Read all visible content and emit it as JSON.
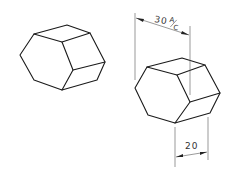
{
  "figure": {
    "left_prism": {
      "label": "hexagonal-prism"
    },
    "right_prism": {
      "label": "hexagonal-prism-dimensioned",
      "dimensions": {
        "across_corners": {
          "value": "30",
          "suffix_top": "A",
          "suffix_bottom": "C"
        },
        "length": {
          "value": "20"
        }
      }
    }
  },
  "colors": {
    "line": "#1a1a1a",
    "dimension": "#555555",
    "background": "#ffffff"
  }
}
